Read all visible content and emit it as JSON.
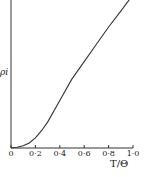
{
  "chart_data": {
    "type": "line",
    "title": "",
    "xlabel": "T/Θ",
    "ylabel": "ρi",
    "xlim": [
      0,
      1.0
    ],
    "ylim": [
      0,
      1.0
    ],
    "grid": false,
    "legend": null,
    "x_ticks": [
      "0",
      "0·2",
      "0·4",
      "0·6",
      "0·8",
      "1·0"
    ],
    "series": [
      {
        "name": "ρi",
        "x": [
          0,
          0.05,
          0.1,
          0.15,
          0.2,
          0.25,
          0.3,
          0.4,
          0.5,
          0.6,
          0.7,
          0.8,
          0.9,
          0.97
        ],
        "y": [
          0,
          0.005,
          0.015,
          0.035,
          0.07,
          0.12,
          0.18,
          0.33,
          0.48,
          0.6,
          0.72,
          0.84,
          0.95,
          1.03
        ]
      }
    ]
  }
}
